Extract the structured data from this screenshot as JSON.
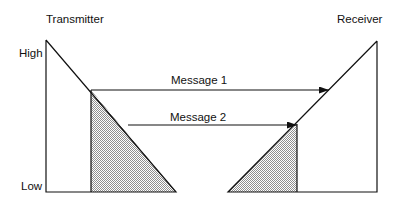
{
  "diagram": {
    "type": "sliding-window message timing",
    "labels": {
      "transmitter": "Transmitter",
      "receiver": "Receiver",
      "high": "High",
      "low": "Low"
    },
    "messages": [
      {
        "label": "Message 1",
        "from": "transmitter",
        "to": "receiver"
      },
      {
        "label": "Message 2",
        "from": "transmitter",
        "to": "receiver"
      }
    ],
    "colors": {
      "stroke": "#111111",
      "shade_dark": "#9a9a9a",
      "shade_light": "#ffffff",
      "background": "#ffffff"
    }
  }
}
